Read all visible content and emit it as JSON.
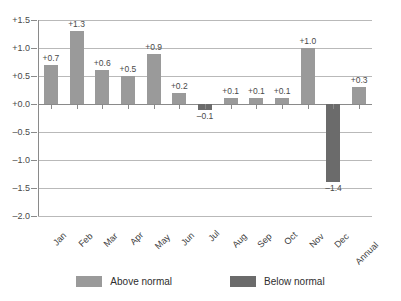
{
  "chart_data": {
    "type": "bar",
    "title": "",
    "subtitle": "",
    "xlabel": "",
    "ylabel": "",
    "categories": [
      "Jan",
      "Feb",
      "Mar",
      "Apr",
      "May",
      "Jun",
      "Jul",
      "Aug",
      "Sep",
      "Oct",
      "Nov",
      "Dec",
      "Annual"
    ],
    "values": [
      0.7,
      1.3,
      0.6,
      0.5,
      0.9,
      0.2,
      -0.1,
      0.1,
      0.1,
      0.1,
      1.0,
      -1.4,
      0.3
    ],
    "value_labels": [
      "+0.7",
      "+1.3",
      "+0.6",
      "+0.5",
      "+0.9",
      "+0.2",
      "–0.1",
      "+0.1",
      "+0.1",
      "+0.1",
      "+1.0",
      "–1.4",
      "+0.3"
    ],
    "ylim": [
      -2.0,
      1.5
    ],
    "yticks": [
      1.5,
      1.0,
      0.5,
      0.0,
      -0.5,
      -1.0,
      -1.5,
      -2.0
    ],
    "ytick_labels": [
      "+1.5",
      "+1.0",
      "+0.5",
      "+0.0",
      "–0.5",
      "–1.0",
      "–1.5",
      "–2.0"
    ],
    "grid": true,
    "legend_position": "bottom-center",
    "series": [
      {
        "name": "Above normal",
        "color": "#9a9a9a"
      },
      {
        "name": "Below normal",
        "color": "#6b6b6b"
      }
    ],
    "colors": {
      "above_normal": "#9a9a9a",
      "below_normal": "#6b6b6b",
      "gridline": "#b9b9b9",
      "axis": "#8a8a8a",
      "text": "#3a3a3a",
      "background": "#ffffff"
    }
  },
  "legend": {
    "items": [
      {
        "label": "Above normal",
        "kind": "pos"
      },
      {
        "label": "Below normal",
        "kind": "neg"
      }
    ]
  }
}
